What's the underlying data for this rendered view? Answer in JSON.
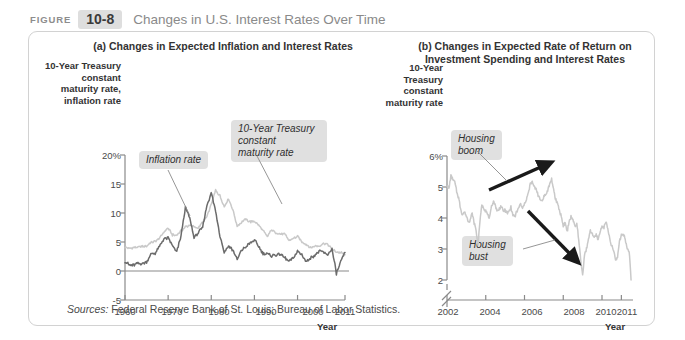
{
  "header": {
    "figure_word": "FIGURE",
    "figure_number": "10-8",
    "title": "Changes in U.S. Interest Rates Over Time"
  },
  "source_note": {
    "label": "Sources:",
    "text": " Federal Reserve Bank of St. Louis; Bureau of Labor Statistics."
  },
  "colors": {
    "dark_series": "#6b6b6b",
    "light_series": "#c9c9c9",
    "axis": "#8a8a8a",
    "callout_bg": "#e0e0e0",
    "arrow": "#1a1a1a",
    "figure_number_bg": "#dedede",
    "title_text": "#8a8a8a",
    "panel_border": "#d2d2d2"
  },
  "chart_data": [
    {
      "id": "panel-a",
      "type": "line",
      "title": "(a) Changes in Expected Inflation\nand Interest Rates",
      "ylabel": "10-Year\nTreasury\nconstant\nmaturity rate,\ninflation rate",
      "xlabel": "Year",
      "yticks": [
        "20%",
        "15",
        "10",
        "5",
        "0",
        "-5"
      ],
      "ytick_values": [
        20,
        15,
        10,
        5,
        0,
        -5
      ],
      "ylim": [
        -5,
        20
      ],
      "xticks": [
        "1960",
        "1970",
        "1980",
        "1990",
        "2000",
        "2011"
      ],
      "xtick_values": [
        1960,
        1970,
        1980,
        1990,
        2000,
        2011
      ],
      "xlim": [
        1960,
        2011
      ],
      "grid": false,
      "zero_line": true,
      "annotations": [
        {
          "label": "Inflation rate",
          "target_series": "Inflation rate"
        },
        {
          "label": "10-Year Treasury\nconstant\nmaturity rate",
          "target_series": "10-Year Treasury constant maturity rate"
        }
      ],
      "series": [
        {
          "name": "10-Year Treasury constant maturity rate",
          "color": "#c9c9c9",
          "x": [
            1960,
            1961,
            1962,
            1963,
            1964,
            1965,
            1966,
            1967,
            1968,
            1969,
            1970,
            1971,
            1972,
            1973,
            1974,
            1975,
            1976,
            1977,
            1978,
            1979,
            1980,
            1981,
            1982,
            1983,
            1984,
            1985,
            1986,
            1987,
            1988,
            1989,
            1990,
            1991,
            1992,
            1993,
            1994,
            1995,
            1996,
            1997,
            1998,
            1999,
            2000,
            2001,
            2002,
            2003,
            2004,
            2005,
            2006,
            2007,
            2008,
            2009,
            2010,
            2011
          ],
          "values": [
            4.1,
            3.9,
            4.0,
            4.1,
            4.2,
            4.3,
            4.9,
            5.1,
            5.6,
            6.7,
            7.4,
            6.2,
            6.2,
            6.9,
            7.6,
            7.9,
            7.6,
            7.4,
            8.4,
            9.4,
            11.5,
            13.9,
            13.0,
            11.1,
            12.5,
            10.6,
            7.7,
            8.4,
            8.9,
            8.5,
            8.6,
            7.9,
            7.0,
            5.9,
            7.1,
            6.6,
            6.4,
            6.4,
            5.3,
            5.6,
            6.0,
            5.0,
            4.6,
            4.0,
            4.3,
            4.3,
            4.8,
            4.6,
            3.7,
            3.3,
            3.2,
            2.8
          ]
        },
        {
          "name": "Inflation rate",
          "color": "#6b6b6b",
          "x": [
            1960,
            1961,
            1962,
            1963,
            1964,
            1965,
            1966,
            1967,
            1968,
            1969,
            1970,
            1971,
            1972,
            1973,
            1974,
            1975,
            1976,
            1977,
            1978,
            1979,
            1980,
            1981,
            1982,
            1983,
            1984,
            1985,
            1986,
            1987,
            1988,
            1989,
            1990,
            1991,
            1992,
            1993,
            1994,
            1995,
            1996,
            1997,
            1998,
            1999,
            2000,
            2001,
            2002,
            2003,
            2004,
            2005,
            2006,
            2007,
            2008,
            2009,
            2010,
            2011
          ],
          "values": [
            1.7,
            1.0,
            1.0,
            1.3,
            1.3,
            1.6,
            2.9,
            3.1,
            4.2,
            5.5,
            5.7,
            4.4,
            3.2,
            6.2,
            11.0,
            9.1,
            5.8,
            6.5,
            7.6,
            11.3,
            13.5,
            10.3,
            6.2,
            3.2,
            4.3,
            3.6,
            1.9,
            3.6,
            4.1,
            4.8,
            5.4,
            4.2,
            3.0,
            3.0,
            2.6,
            2.8,
            3.0,
            2.3,
            1.6,
            2.2,
            3.4,
            2.8,
            1.6,
            2.3,
            2.7,
            3.4,
            3.2,
            2.8,
            3.8,
            -0.4,
            1.6,
            3.2
          ]
        }
      ]
    },
    {
      "id": "panel-b",
      "type": "line",
      "title": "(b) Changes in Expected Rate of Return on\nInvestment Spending and Interest Rates",
      "ylabel": "10-Year\nTreasury\nconstant\nmaturity rate",
      "xlabel": "Year",
      "yticks": [
        "6%",
        "5",
        "4",
        "3",
        "2"
      ],
      "ytick_values": [
        6,
        5,
        4,
        3,
        2
      ],
      "ylim": [
        2,
        6
      ],
      "axis_break": true,
      "xticks": [
        "2002",
        "2004",
        "2006",
        "2008",
        "2010",
        "2011"
      ],
      "xtick_values": [
        2002,
        2004,
        2006,
        2008,
        2010,
        2011
      ],
      "xlim": [
        2002,
        2011.6
      ],
      "grid": false,
      "annotations": [
        {
          "label": "Housing\nboom",
          "arrow": "up-right"
        },
        {
          "label": "Housing\nbust",
          "arrow": "down-right"
        }
      ],
      "series": [
        {
          "name": "10-Year Treasury constant maturity rate",
          "color": "#c9c9c9",
          "x": [
            2002.0,
            2002.1,
            2002.2,
            2002.3,
            2002.4,
            2002.5,
            2002.6,
            2002.7,
            2002.8,
            2002.9,
            2003.0,
            2003.1,
            2003.2,
            2003.3,
            2003.4,
            2003.5,
            2003.6,
            2003.7,
            2003.8,
            2003.9,
            2004.0,
            2004.1,
            2004.2,
            2004.3,
            2004.4,
            2004.5,
            2004.6,
            2004.7,
            2004.8,
            2004.9,
            2005.0,
            2005.1,
            2005.2,
            2005.3,
            2005.4,
            2005.5,
            2005.6,
            2005.7,
            2005.8,
            2005.9,
            2006.0,
            2006.1,
            2006.2,
            2006.3,
            2006.4,
            2006.5,
            2006.6,
            2006.7,
            2006.8,
            2006.9,
            2007.0,
            2007.1,
            2007.2,
            2007.3,
            2007.4,
            2007.5,
            2007.6,
            2007.7,
            2007.8,
            2007.9,
            2008.0,
            2008.1,
            2008.2,
            2008.3,
            2008.4,
            2008.5,
            2008.6,
            2008.7,
            2008.8,
            2008.9,
            2009.0,
            2009.1,
            2009.2,
            2009.3,
            2009.4,
            2009.5,
            2009.6,
            2009.7,
            2009.8,
            2009.9,
            2010.0,
            2010.1,
            2010.2,
            2010.3,
            2010.4,
            2010.5,
            2010.6,
            2010.7,
            2010.8,
            2010.9,
            2011.0,
            2011.1,
            2011.2,
            2011.3,
            2011.4,
            2011.5
          ],
          "values": [
            5.05,
            4.95,
            5.35,
            5.25,
            5.15,
            4.85,
            4.65,
            4.3,
            4.1,
            4.2,
            4.05,
            3.9,
            3.95,
            4.15,
            3.85,
            3.6,
            3.15,
            3.9,
            4.4,
            4.3,
            4.25,
            4.1,
            4.0,
            4.35,
            4.55,
            4.4,
            4.2,
            4.3,
            4.4,
            4.2,
            4.25,
            4.15,
            4.2,
            4.35,
            4.1,
            4.05,
            4.2,
            4.35,
            4.45,
            4.3,
            4.45,
            4.6,
            4.8,
            5.1,
            5.15,
            5.0,
            4.95,
            4.75,
            4.6,
            4.55,
            4.7,
            4.75,
            4.9,
            5.1,
            5.25,
            4.9,
            4.6,
            4.5,
            4.25,
            4.05,
            3.75,
            3.85,
            3.55,
            3.85,
            4.05,
            3.95,
            3.7,
            3.8,
            3.3,
            2.65,
            2.15,
            2.85,
            3.0,
            3.3,
            3.6,
            3.5,
            3.35,
            3.45,
            3.3,
            3.55,
            3.75,
            3.7,
            3.9,
            3.65,
            3.3,
            3.1,
            2.95,
            2.65,
            2.75,
            3.25,
            3.45,
            3.5,
            3.3,
            3.0,
            2.95,
            2.0
          ]
        }
      ]
    }
  ]
}
